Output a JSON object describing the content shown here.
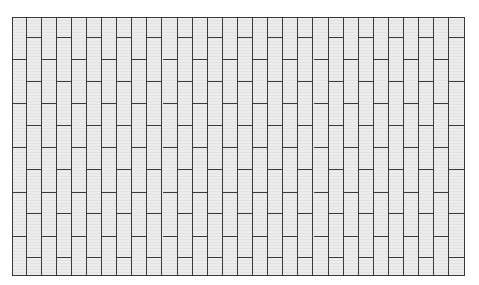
{
  "figure": {
    "type": "stack-bond-paving-pattern",
    "caption_fragment_visible": "",
    "grid": {
      "left": 12,
      "top": 17,
      "width": 453,
      "height": 259,
      "columns": 30,
      "brick_height": 44,
      "odd_column_joints_y": [
        59,
        103,
        147,
        192,
        236
      ],
      "even_column_joints_y": [
        37,
        81,
        125,
        169,
        213,
        257
      ]
    },
    "colors": {
      "fill": "#ececec",
      "line": "#3a3a3a",
      "background": "#ffffff"
    }
  }
}
